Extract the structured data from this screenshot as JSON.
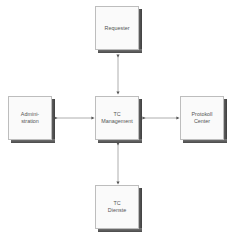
{
  "diagram": {
    "nodes": [
      {
        "id": "requester",
        "label": "Requester"
      },
      {
        "id": "administration",
        "label": "Admini-\nstration"
      },
      {
        "id": "tc_management",
        "label": "TC\nManagement"
      },
      {
        "id": "protokoll_center",
        "label": "Protokoll\nCenter"
      },
      {
        "id": "tc_dienste",
        "label": "TC\nDienste"
      }
    ],
    "edges": [
      {
        "from": "tc_management",
        "to": "requester",
        "style": "bidirectional-arrow"
      },
      {
        "from": "tc_management",
        "to": "administration",
        "style": "bidirectional-arrow"
      },
      {
        "from": "tc_management",
        "to": "protokoll_center",
        "style": "bidirectional-arrow"
      },
      {
        "from": "tc_management",
        "to": "tc_dienste",
        "style": "bidirectional-arrow"
      }
    ],
    "colors": {
      "box_face": "#fafafa",
      "box_border": "#bdbdbd",
      "box_shadow": "#4a4a4a",
      "line": "#9a9a9a",
      "text": "#555555"
    }
  }
}
